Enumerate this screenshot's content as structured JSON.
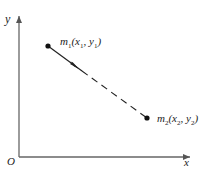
{
  "diagram": {
    "axes": {
      "x_label": "x",
      "y_label": "y",
      "origin_label": "O",
      "color": "#555555"
    },
    "points": [
      {
        "id": "m1",
        "name": "m",
        "sub": "1",
        "coords": "(x",
        "xsub": "1",
        "sep": ", y",
        "ysub": "1",
        "close": ")"
      },
      {
        "id": "m2",
        "name": "m",
        "sub": "2",
        "coords": "(x",
        "xsub": "2",
        "sep": ", y",
        "ysub": "2",
        "close": ")"
      }
    ],
    "segment": {
      "from": "m1",
      "to": "m2",
      "style": "solid then dashed, arrow toward m2",
      "color": "#222222"
    }
  }
}
